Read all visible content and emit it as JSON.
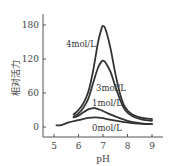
{
  "chart_data": {
    "type": "line",
    "title": "",
    "xlabel": "pH",
    "ylabel": "相对活力",
    "xlim": [
      4.6,
      9.3
    ],
    "ylim": [
      -18,
      190
    ],
    "x_ticks": [
      5,
      6,
      7,
      8,
      9
    ],
    "y_ticks": [
      0,
      60,
      120,
      180
    ],
    "grid": false,
    "legend": "inline labels",
    "series": [
      {
        "name": "4mol/L",
        "label_pos": {
          "x": 6.0,
          "y": 148
        },
        "points": [
          [
            5.8,
            22
          ],
          [
            6.0,
            30
          ],
          [
            6.2,
            42
          ],
          [
            6.4,
            62
          ],
          [
            6.6,
            100
          ],
          [
            6.8,
            150
          ],
          [
            6.95,
            175
          ],
          [
            7.0,
            178
          ],
          [
            7.1,
            173
          ],
          [
            7.3,
            140
          ],
          [
            7.5,
            95
          ],
          [
            7.7,
            58
          ],
          [
            7.9,
            35
          ],
          [
            8.2,
            22
          ],
          [
            8.6,
            16
          ],
          [
            9.0,
            14
          ]
        ]
      },
      {
        "name": "3mol/L",
        "label_pos": {
          "x": 7.2,
          "y": 72
        },
        "points": [
          [
            5.8,
            18
          ],
          [
            6.0,
            24
          ],
          [
            6.2,
            34
          ],
          [
            6.4,
            50
          ],
          [
            6.6,
            78
          ],
          [
            6.8,
            105
          ],
          [
            6.95,
            116
          ],
          [
            7.0,
            117
          ],
          [
            7.1,
            114
          ],
          [
            7.3,
            98
          ],
          [
            7.5,
            72
          ],
          [
            7.7,
            48
          ],
          [
            7.9,
            30
          ],
          [
            8.2,
            19
          ],
          [
            8.6,
            13
          ],
          [
            9.0,
            11
          ]
        ]
      },
      {
        "name": "1mol/L",
        "label_pos": {
          "x": 7.2,
          "y": 44
        },
        "points": [
          [
            5.8,
            17
          ],
          [
            6.0,
            20
          ],
          [
            6.2,
            26
          ],
          [
            6.4,
            31
          ],
          [
            6.6,
            33.5
          ],
          [
            6.7,
            33
          ],
          [
            6.9,
            30
          ],
          [
            7.2,
            24
          ],
          [
            7.6,
            17
          ],
          [
            8.0,
            11
          ],
          [
            8.5,
            7
          ],
          [
            9.0,
            5
          ]
        ]
      },
      {
        "name": "0mol/L",
        "label_pos": {
          "x": 7.1,
          "y": 0
        },
        "points": [
          [
            5.1,
            3
          ],
          [
            5.3,
            3.5
          ],
          [
            5.6,
            8
          ],
          [
            6.0,
            12
          ],
          [
            6.4,
            16
          ],
          [
            6.7,
            17
          ],
          [
            7.0,
            15.5
          ],
          [
            7.4,
            12
          ],
          [
            7.8,
            9
          ],
          [
            8.2,
            7
          ],
          [
            8.6,
            5.5
          ],
          [
            9.0,
            5
          ]
        ]
      }
    ]
  }
}
